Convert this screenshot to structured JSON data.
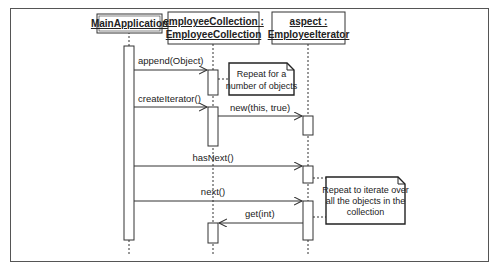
{
  "diagram": {
    "type": "uml-sequence-diagram",
    "participants": [
      {
        "id": "main",
        "lines": [
          "MainApplication"
        ]
      },
      {
        "id": "collection",
        "lines": [
          "employeeCollection :",
          "EmployeeCollection"
        ]
      },
      {
        "id": "iterator",
        "lines": [
          "aspect :",
          "EmployeeIterator"
        ]
      }
    ],
    "messages": [
      {
        "label": "append(Object)",
        "from": "main",
        "to": "collection"
      },
      {
        "label": "createIterator()",
        "from": "main",
        "to": "collection"
      },
      {
        "label": "new(this, true)",
        "from": "collection",
        "to": "iterator"
      },
      {
        "label": "hasNext()",
        "from": "main",
        "to": "iterator"
      },
      {
        "label": "next()",
        "from": "main",
        "to": "iterator"
      },
      {
        "label": "get(int)",
        "from": "iterator",
        "to": "collection"
      }
    ],
    "notes": [
      {
        "lines": [
          "Repeat for a",
          "number of objects"
        ]
      },
      {
        "lines": [
          "Repeat to iterate over",
          "all the objects in the",
          "collection"
        ]
      }
    ]
  }
}
